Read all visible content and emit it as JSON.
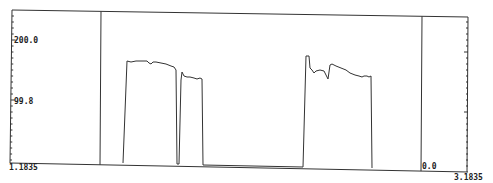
{
  "chart_data": {
    "type": "line",
    "title": "",
    "xlabel": "",
    "ylabel": "",
    "y_tick_labels": [
      "200.0",
      "99.8"
    ],
    "x_range_labels": {
      "left": "1.1835",
      "right": "3.1835"
    },
    "baseline_label": "0.0",
    "ylim": [
      0,
      260
    ],
    "grid": false,
    "legend": null,
    "markers": [
      {
        "name": "left-marker",
        "x_px": 101
      },
      {
        "name": "right-marker",
        "x_px": 422
      }
    ],
    "series": [
      {
        "name": "signal",
        "points_px": [
          [
            123,
            163
          ],
          [
            127,
            61
          ],
          [
            131,
            62
          ],
          [
            136,
            61
          ],
          [
            141,
            61
          ],
          [
            147,
            61
          ],
          [
            149,
            63
          ],
          [
            151,
            64
          ],
          [
            153,
            62
          ],
          [
            156,
            62
          ],
          [
            161,
            63
          ],
          [
            166,
            64
          ],
          [
            171,
            66
          ],
          [
            174,
            67
          ],
          [
            176,
            70
          ],
          [
            177,
            164
          ],
          [
            179,
            164
          ],
          [
            181,
            80
          ],
          [
            182,
            72
          ],
          [
            184,
            76
          ],
          [
            187,
            77
          ],
          [
            190,
            77
          ],
          [
            194,
            78
          ],
          [
            197,
            79
          ],
          [
            200,
            78
          ],
          [
            202,
            79
          ],
          [
            203,
            165
          ],
          [
            303,
            167
          ],
          [
            306,
            56
          ],
          [
            309,
            56
          ],
          [
            310,
            68
          ],
          [
            312,
            70
          ],
          [
            314,
            73
          ],
          [
            316,
            71
          ],
          [
            320,
            70
          ],
          [
            324,
            71
          ],
          [
            326,
            75
          ],
          [
            328,
            79
          ],
          [
            330,
            65
          ],
          [
            332,
            64
          ],
          [
            336,
            66
          ],
          [
            341,
            68
          ],
          [
            346,
            70
          ],
          [
            350,
            73
          ],
          [
            355,
            75
          ],
          [
            359,
            76
          ],
          [
            362,
            77
          ],
          [
            364,
            76
          ],
          [
            367,
            76
          ],
          [
            369,
            77
          ],
          [
            371,
            76
          ],
          [
            372,
            168
          ]
        ]
      }
    ],
    "colors": {
      "line": "#333333",
      "frame": "#333333",
      "background": "#ffffff"
    }
  }
}
